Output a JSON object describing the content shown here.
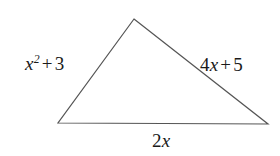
{
  "figure": {
    "type": "triangle-diagram",
    "background_color": "#ffffff",
    "stroke_color": "#555555",
    "stroke_width": 1.2,
    "text_color": "#1a1a1a",
    "vertices": {
      "apex": [
        134,
        19
      ],
      "bottom_left": [
        58,
        123
      ],
      "bottom_right": [
        268,
        124
      ]
    }
  },
  "labels": {
    "left_side": {
      "text": "x^2 + 3",
      "base": "x",
      "exponent": "2",
      "operator": "+",
      "constant": "3"
    },
    "right_side": {
      "text": "4x + 5",
      "coefficient": "4",
      "variable": "x",
      "operator": "+",
      "constant": "5"
    },
    "bottom_side": {
      "text": "2x",
      "coefficient": "2",
      "variable": "x"
    }
  }
}
